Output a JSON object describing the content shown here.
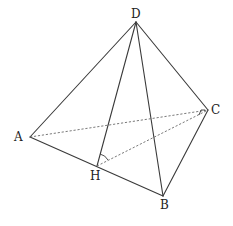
{
  "diagram": {
    "type": "tetrahedron",
    "vertices": {
      "D": {
        "label": "D",
        "x": 136,
        "y": 22,
        "lx": 131,
        "ly": 18
      },
      "C": {
        "label": "C",
        "x": 208,
        "y": 110,
        "lx": 211,
        "ly": 114
      },
      "A": {
        "label": "A",
        "x": 30,
        "y": 137,
        "lx": 14,
        "ly": 141
      },
      "H": {
        "label": "H",
        "x": 97,
        "y": 166,
        "lx": 90,
        "ly": 180
      },
      "B": {
        "label": "B",
        "x": 163,
        "y": 196,
        "lx": 160,
        "ly": 209
      }
    },
    "solid_edges": [
      "DA",
      "DC",
      "DB",
      "DH",
      "AB",
      "BC"
    ],
    "dashed_edges": [
      "AC",
      "HC"
    ],
    "marks": {
      "right_angle_at": "C",
      "angle_arc_at": "H"
    }
  }
}
